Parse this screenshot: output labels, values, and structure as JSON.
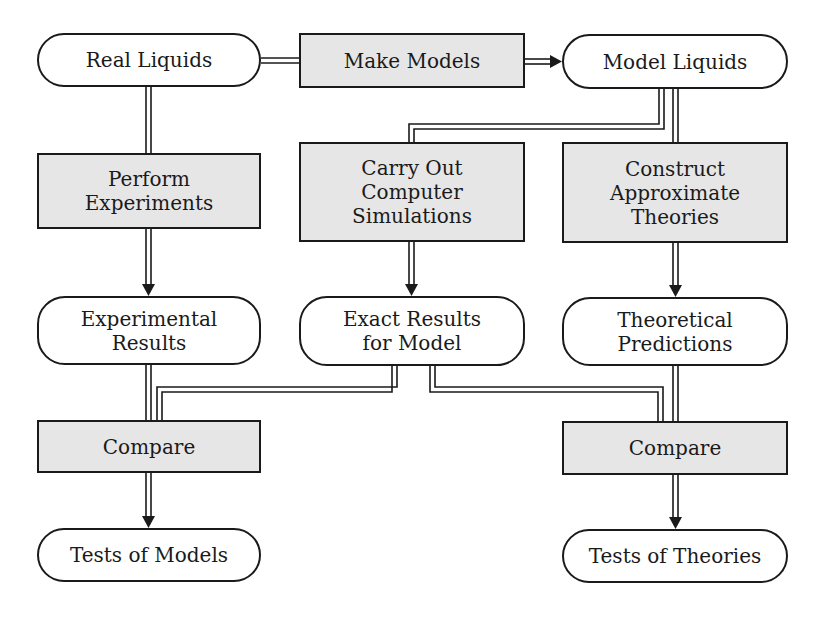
{
  "diagram": {
    "type": "flowchart",
    "colors": {
      "stroke": "#1a1a1a",
      "process_fill": "#e6e6e6",
      "terminal_fill": "#ffffff"
    },
    "nodes": {
      "real_liquids": {
        "shape": "rounded",
        "lines": [
          "Real Liquids"
        ]
      },
      "make_models": {
        "shape": "rectangle",
        "lines": [
          "Make Models"
        ]
      },
      "model_liquids": {
        "shape": "rounded",
        "lines": [
          "Model Liquids"
        ]
      },
      "perform_experiments": {
        "shape": "rectangle",
        "lines": [
          "Perform",
          "Experiments"
        ]
      },
      "computer_simulations": {
        "shape": "rectangle",
        "lines": [
          "Carry Out",
          "Computer",
          "Simulations"
        ]
      },
      "approximate_theories": {
        "shape": "rectangle",
        "lines": [
          "Construct",
          "Approximate",
          "Theories"
        ]
      },
      "experimental_results": {
        "shape": "rounded",
        "lines": [
          "Experimental",
          "Results"
        ]
      },
      "exact_results": {
        "shape": "rounded",
        "lines": [
          "Exact Results",
          "for Model"
        ]
      },
      "theoretical_predictions": {
        "shape": "rounded",
        "lines": [
          "Theoretical",
          "Predictions"
        ]
      },
      "compare_left": {
        "shape": "rectangle",
        "lines": [
          "Compare"
        ]
      },
      "compare_right": {
        "shape": "rectangle",
        "lines": [
          "Compare"
        ]
      },
      "tests_of_models": {
        "shape": "rounded",
        "lines": [
          "Tests of Models"
        ]
      },
      "tests_of_theories": {
        "shape": "rounded",
        "lines": [
          "Tests of Theories"
        ]
      }
    },
    "edges": [
      {
        "from": "Real Liquids",
        "to": "Make Models",
        "arrow": false
      },
      {
        "from": "Make Models",
        "to": "Model Liquids",
        "arrow": true
      },
      {
        "from": "Real Liquids",
        "to": "Perform Experiments",
        "arrow": false
      },
      {
        "from": "Model Liquids",
        "to": "Carry Out Computer Simulations",
        "arrow": false
      },
      {
        "from": "Model Liquids",
        "to": "Construct Approximate Theories",
        "arrow": false
      },
      {
        "from": "Perform Experiments",
        "to": "Experimental Results",
        "arrow": true
      },
      {
        "from": "Carry Out Computer Simulations",
        "to": "Exact Results for Model",
        "arrow": true
      },
      {
        "from": "Construct Approximate Theories",
        "to": "Theoretical Predictions",
        "arrow": true
      },
      {
        "from": "Experimental Results",
        "to": "Compare (left)",
        "arrow": false
      },
      {
        "from": "Exact Results for Model",
        "to": "Compare (left)",
        "arrow": false
      },
      {
        "from": "Exact Results for Model",
        "to": "Compare (right)",
        "arrow": false
      },
      {
        "from": "Theoretical Predictions",
        "to": "Compare (right)",
        "arrow": false
      },
      {
        "from": "Compare (left)",
        "to": "Tests of Models",
        "arrow": true
      },
      {
        "from": "Compare (right)",
        "to": "Tests of Theories",
        "arrow": true
      }
    ]
  }
}
